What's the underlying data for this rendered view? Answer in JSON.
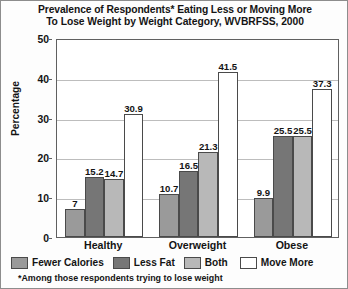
{
  "chart_data": {
    "type": "bar",
    "title": "Prevalence of Respondents* Eating Less or Moving More To Lose Weight by Weight Category, WVBRFSS, 2000",
    "title_lines": [
      "Prevalence of Respondents* Eating Less or Moving More",
      "To Lose Weight by Weight Category, WVBRFSS, 2000"
    ],
    "xlabel": "",
    "ylabel": "Percentage",
    "ylim": [
      0,
      50
    ],
    "ytick_step": 10,
    "yticks": [
      "0",
      "10",
      "20",
      "30",
      "40",
      "50"
    ],
    "grid": true,
    "grid_axis": "y",
    "legend_position": "bottom",
    "categories": [
      "Healthy",
      "Overweight",
      "Obese"
    ],
    "series": [
      {
        "name": "Fewer Calories",
        "color": "#9a9a9a",
        "values": [
          7,
          10.7,
          9.9
        ],
        "labels": [
          "7",
          "10.7",
          "9.9"
        ]
      },
      {
        "name": "Less Fat",
        "color": "#767676",
        "values": [
          15.2,
          16.5,
          25.5
        ],
        "labels": [
          "15.2",
          "16.5",
          "25.5"
        ]
      },
      {
        "name": "Both",
        "color": "#b8b8b8",
        "values": [
          14.7,
          21.3,
          25.5
        ],
        "labels": [
          "14.7",
          "21.3",
          "25.5"
        ]
      },
      {
        "name": "Move More",
        "color": "#ffffff",
        "values": [
          30.9,
          41.5,
          37.3
        ],
        "labels": [
          "30.9",
          "41.5",
          "37.3"
        ]
      }
    ],
    "footnote": "*Among those respondents trying to lose weight"
  },
  "colors": {
    "fewer_calories": "#9a9a9a",
    "less_fat": "#767676",
    "both": "#b8b8b8",
    "move_more": "#ffffff",
    "bar_outline": "#4a4a4a",
    "axis": "#606060",
    "gridline": "#bdbdbd",
    "text": "#141414",
    "frame": "#8d8d8d"
  }
}
